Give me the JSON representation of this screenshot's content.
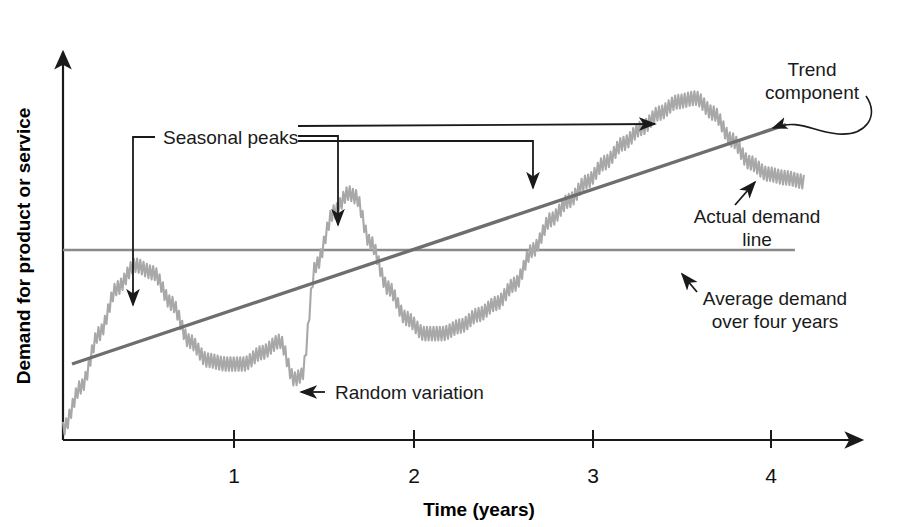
{
  "figure": {
    "background_color": "#ffffff",
    "width": 913,
    "height": 527
  },
  "axes": {
    "x_title": "Time (years)",
    "y_title": "Demand for product or service",
    "x_tick_labels": [
      "1",
      "2",
      "3",
      "4"
    ],
    "y_tick_labels": [],
    "axis_color": "#1a1a1a"
  },
  "annotations": {
    "seasonal_peaks": "Seasonal peaks",
    "trend_component_line1": "Trend",
    "trend_component_line2": "component",
    "actual_demand_line1": "Actual demand",
    "actual_demand_line2": "line",
    "average_demand_line1": "Average demand",
    "average_demand_line2": "over four years",
    "random_variation": "Random variation"
  },
  "colors": {
    "actual_demand_curve": "#a8a8a8",
    "trend_line": "#6e6e6e",
    "average_line": "#8a8a8a",
    "annotation": "#1a1a1a"
  },
  "chart_data": {
    "type": "line",
    "title": "",
    "subtitle": "",
    "xlabel": "Time (years)",
    "ylabel": "Demand for product or service",
    "xlim": [
      0,
      4.2
    ],
    "ylim": [
      0,
      1
    ],
    "grid": false,
    "legend": "none",
    "x_ticks": [
      1,
      2,
      3,
      4
    ],
    "x_tick_labels": [
      "1",
      "2",
      "3",
      "4"
    ],
    "y_ticks": [],
    "series": [
      {
        "name": "Actual demand line",
        "type": "line",
        "color": "#a8a8a8",
        "note": "Seasonal wave with upward trend plus high-frequency random variation (sawtooth noise).",
        "x": [
          0.0,
          0.1,
          0.2,
          0.3,
          0.4,
          0.5,
          0.6,
          0.7,
          0.8,
          0.9,
          1.0,
          1.1,
          1.2,
          1.28,
          1.32,
          1.4,
          1.5,
          1.58,
          1.62,
          1.7,
          1.8,
          1.9,
          2.0,
          2.1,
          2.2,
          2.3,
          2.4,
          2.5,
          2.6,
          2.7,
          2.8,
          2.9,
          3.0,
          3.1,
          3.2,
          3.3,
          3.4,
          3.5,
          3.6,
          3.7,
          3.8,
          3.9,
          4.0,
          4.1
        ],
        "y": [
          0.03,
          0.14,
          0.28,
          0.4,
          0.46,
          0.44,
          0.36,
          0.26,
          0.21,
          0.2,
          0.2,
          0.23,
          0.26,
          0.16,
          0.17,
          0.46,
          0.6,
          0.65,
          0.64,
          0.52,
          0.4,
          0.32,
          0.28,
          0.28,
          0.3,
          0.33,
          0.36,
          0.41,
          0.5,
          0.58,
          0.63,
          0.68,
          0.73,
          0.78,
          0.82,
          0.86,
          0.89,
          0.9,
          0.86,
          0.79,
          0.73,
          0.7,
          0.69,
          0.68
        ]
      },
      {
        "name": "Trend component",
        "type": "line",
        "color": "#6e6e6e",
        "note": "Straight upward-sloping line from start to end of four-year span.",
        "x": [
          0.05,
          4.0
        ],
        "y": [
          0.2,
          0.83
        ]
      },
      {
        "name": "Average demand over four years",
        "type": "line",
        "color": "#8a8a8a",
        "note": "Horizontal constant line across the full four-year span.",
        "x": [
          0.0,
          4.05
        ],
        "y": [
          0.5,
          0.5
        ]
      }
    ],
    "annotations": [
      {
        "text": "Seasonal peaks",
        "points_to": [
          "peak near year 0.45",
          "peak near year 1.6",
          "peak near year 2.6",
          "peak near year 3.5"
        ]
      },
      {
        "text": "Trend component",
        "points_to": "trend line near year 4"
      },
      {
        "text": "Actual demand line",
        "points_to": "demand curve near year 3.8"
      },
      {
        "text": "Average demand over four years",
        "points_to": "horizontal average line near year 3.5"
      },
      {
        "text": "Random variation",
        "points_to": "jagged noise near year 1.3"
      }
    ]
  }
}
